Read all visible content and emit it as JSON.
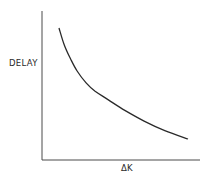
{
  "chart_data": {
    "type": "line",
    "title": "",
    "xlabel": "ΔK",
    "ylabel": "DELAY",
    "grid": false,
    "legend": null,
    "axis_ticks": false,
    "series": [
      {
        "name": "delay",
        "x_rel": [
          0.0,
          0.04,
          0.09,
          0.14,
          0.21,
          0.28,
          0.38,
          0.51,
          0.66,
          0.82,
          1.0
        ],
        "y_rel": [
          1.0,
          0.86,
          0.74,
          0.64,
          0.54,
          0.47,
          0.4,
          0.31,
          0.22,
          0.14,
          0.07
        ]
      }
    ]
  },
  "labels": {
    "ylabel": "DELAY",
    "xlabel": "ΔK"
  },
  "colors": {
    "line": "#2a2a2a",
    "axis": "#4a4a4a",
    "background": "#ffffff"
  }
}
